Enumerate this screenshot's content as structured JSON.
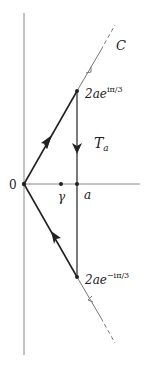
{
  "diagram": {
    "type": "contour-in-complex-plane",
    "labels": {
      "origin": "0",
      "gamma": "γ",
      "a": "a",
      "contour_C": "C",
      "T_main": "T",
      "T_sub": "a",
      "top_point_base": "2ae",
      "top_point_exp": "iπ/3",
      "bottom_point_base": "2ae",
      "bottom_point_exp": "−iπ/3"
    },
    "colors": {
      "axis": "#888888",
      "contour": "#222222",
      "ray": "#777777"
    }
  }
}
